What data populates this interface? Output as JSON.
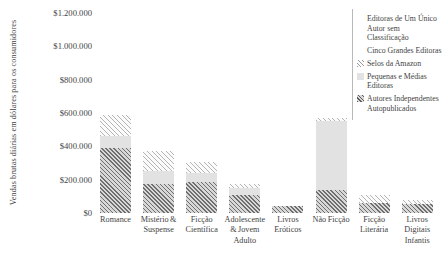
{
  "chart_data": {
    "type": "bar",
    "subtype": "stacked",
    "title": "",
    "xlabel": "",
    "ylabel": "Vendas brutas diárias em dólares para os consumidores",
    "ylim": [
      0,
      1200000
    ],
    "ytick_labels": [
      "$1.200.000",
      "$1.000.000",
      "$800.000",
      "$600.000",
      "$400.000",
      "$200.000",
      "$0"
    ],
    "ytick_values": [
      1200000,
      1000000,
      800000,
      600000,
      400000,
      200000,
      0
    ],
    "grid": false,
    "legend_position": "top-right",
    "categories": [
      "Romance",
      "Mistério & Suspense",
      "Ficção Científica",
      "Adolescente & Jovem Adulto",
      "Livros Eróticos",
      "Não Ficção",
      "Ficção Literária",
      "Livros Digitais Infantis"
    ],
    "series": [
      {
        "name": "Autores Independentes Autopublicados",
        "key": "indep",
        "fill": "dark-hatch",
        "values": [
          390000,
          175000,
          185000,
          110000,
          45000,
          140000,
          60000,
          55000
        ]
      },
      {
        "name": "Pequenas e Médias Editoras",
        "key": "small",
        "fill": "light-gray",
        "values": [
          75000,
          75000,
          55000,
          40000,
          0,
          415000,
          0,
          0
        ]
      },
      {
        "name": "Selos da Amazon",
        "key": "amazon",
        "fill": "light-hatch",
        "values": [
          125000,
          120000,
          65000,
          25000,
          0,
          15000,
          50000,
          25000
        ]
      },
      {
        "name": "Cinco Grandes Editoras",
        "key": "big",
        "fill": "white",
        "values": [
          0,
          0,
          0,
          0,
          0,
          0,
          0,
          0
        ]
      },
      {
        "name": "Editoras de Um Único Autor sem Classificação",
        "key": "single",
        "fill": "white",
        "values": [
          0,
          0,
          0,
          0,
          0,
          0,
          0,
          0
        ]
      }
    ],
    "totals": [
      590000,
      370000,
      305000,
      175000,
      45000,
      570000,
      110000,
      80000
    ]
  },
  "legend": {
    "items": [
      {
        "label": "Editoras de Um Único Autor sem Classificação",
        "swatch": "white-swatch"
      },
      {
        "label": "Cinco Grandes Editoras",
        "swatch": "white-swatch"
      },
      {
        "label": "Selos da Amazon",
        "swatch": "light-hatch-swatch"
      },
      {
        "label": "Pequenas e Médias Editoras",
        "swatch": "light-gray-swatch"
      },
      {
        "label": "Autores Independentes Autopublicados",
        "swatch": "dark-hatch-swatch"
      }
    ]
  },
  "colors": {
    "dark_hatch_line": "#6f6f6f",
    "dark_hatch_bg": "#d8d8d8",
    "light_gray": "#e2e2e2",
    "light_hatch_line": "#b4b4b4",
    "light_hatch_bg": "#fbfbfb",
    "text": "#3f3f3f",
    "legend_border": "#b9b9b9"
  }
}
